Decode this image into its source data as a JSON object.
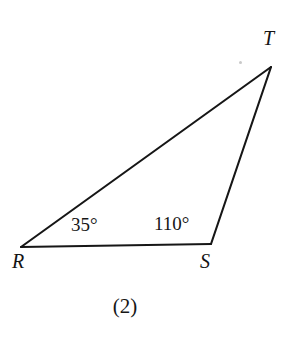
{
  "figure": {
    "caption": "(2)",
    "shape": "triangle",
    "stroke_color": "#161616",
    "stroke_width": 2.1,
    "background_color": "#ffffff",
    "vertices": [
      {
        "name": "R",
        "label": "R",
        "x": 21,
        "y": 247
      },
      {
        "name": "S",
        "label": "S",
        "x": 211,
        "y": 244
      },
      {
        "name": "T",
        "label": "T",
        "x": 271,
        "y": 67
      }
    ],
    "sides": [
      {
        "name": "RS",
        "from": "R",
        "to": "S"
      },
      {
        "name": "ST",
        "from": "S",
        "to": "T"
      },
      {
        "name": "TR",
        "from": "T",
        "to": "R"
      }
    ],
    "angles": [
      {
        "at": "R",
        "label": "35°",
        "value": 35
      },
      {
        "at": "S",
        "label": "110°",
        "value": 110
      }
    ]
  }
}
